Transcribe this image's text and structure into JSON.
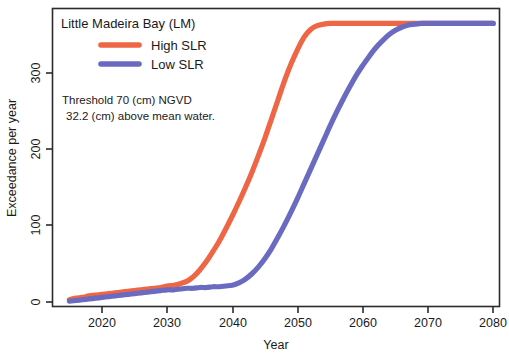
{
  "chart_data": {
    "type": "line",
    "title": "Little Madeira Bay (LM)",
    "xlabel": "Year",
    "ylabel": "Exceedance per year",
    "xlim": [
      2015,
      2080
    ],
    "ylim": [
      0,
      375
    ],
    "grid": false,
    "legend_position": "top-left",
    "annotations": [
      "Threshold 70 (cm) NGVD",
      "32.2 (cm) above mean water."
    ],
    "xticks": [
      2020,
      2030,
      2040,
      2050,
      2060,
      2070,
      2080
    ],
    "xtick_labels": [
      "2020",
      "2030",
      "2040",
      "2050",
      "2060",
      "2070",
      "2080"
    ],
    "yticks": [
      0,
      100,
      200,
      300
    ],
    "ytick_labels": [
      "0",
      "100",
      "200",
      "300"
    ],
    "x": [
      2015,
      2016,
      2017,
      2018,
      2019,
      2020,
      2021,
      2022,
      2023,
      2024,
      2025,
      2026,
      2027,
      2028,
      2029,
      2030,
      2031,
      2032,
      2033,
      2034,
      2035,
      2036,
      2037,
      2038,
      2039,
      2040,
      2041,
      2042,
      2043,
      2044,
      2045,
      2046,
      2047,
      2048,
      2049,
      2050,
      2051,
      2052,
      2053,
      2054,
      2055,
      2056,
      2057,
      2058,
      2059,
      2060,
      2061,
      2062,
      2063,
      2064,
      2065,
      2066,
      2067,
      2068,
      2069,
      2070,
      2071,
      2072,
      2073,
      2074,
      2075,
      2076,
      2077,
      2078,
      2079,
      2080
    ],
    "series": [
      {
        "name": "High SLR",
        "color": "#ee6644",
        "values": [
          3,
          5,
          6,
          8,
          9,
          10,
          11,
          12,
          13,
          14,
          15,
          16,
          17,
          18,
          19,
          21,
          22,
          24,
          27,
          33,
          42,
          53,
          66,
          80,
          96,
          113,
          131,
          150,
          170,
          192,
          215,
          240,
          265,
          290,
          312,
          331,
          347,
          357,
          362,
          364,
          365,
          365,
          365,
          365,
          365,
          365,
          365,
          365,
          365,
          365,
          365,
          365,
          365,
          365,
          365,
          365,
          365,
          365,
          365,
          365,
          365,
          365,
          365,
          365,
          365,
          365
        ]
      },
      {
        "name": "Low SLR",
        "color": "#6a6bc0",
        "values": [
          1,
          2,
          3,
          4,
          5,
          6,
          7,
          8,
          9,
          10,
          11,
          12,
          13,
          14,
          15,
          16,
          16,
          17,
          18,
          18,
          19,
          19,
          20,
          20,
          21,
          22,
          25,
          30,
          37,
          46,
          57,
          70,
          85,
          101,
          118,
          136,
          155,
          174,
          193,
          212,
          231,
          249,
          266,
          282,
          297,
          310,
          322,
          333,
          342,
          350,
          356,
          360,
          363,
          364,
          365,
          365,
          365,
          365,
          365,
          365,
          365,
          365,
          365,
          365,
          365,
          365
        ]
      }
    ]
  },
  "legend": {
    "entries": [
      {
        "label": "High SLR",
        "color": "#ee6644"
      },
      {
        "label": "Low SLR",
        "color": "#6a6bc0"
      }
    ]
  }
}
